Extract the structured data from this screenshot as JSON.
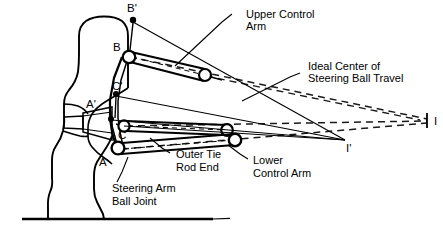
{
  "figure": {
    "colors": {
      "line": "#000000",
      "background": "#ffffff",
      "dashed": "#1a1a1a"
    }
  },
  "labels": {
    "upper_control_arm_l1": "Upper Control",
    "upper_control_arm_l2": "Arm",
    "ideal_center_l1": "Ideal Center of",
    "ideal_center_l2": "Steering Ball Travel",
    "outer_tie_rod_l1": "Outer Tie",
    "outer_tie_rod_l2": "Rod End",
    "lower_control_arm_l1": "Lower",
    "lower_control_arm_l2": "Control Arm",
    "steering_arm_ball_joint_l1": "Steering Arm",
    "steering_arm_ball_joint_l2": "Ball Joint"
  },
  "points": {
    "B_prime": "B'",
    "B": "B",
    "C_prime": "C'",
    "C": "C",
    "A_prime": "A'",
    "A": "A",
    "I": "I",
    "I_prime": "I'"
  }
}
